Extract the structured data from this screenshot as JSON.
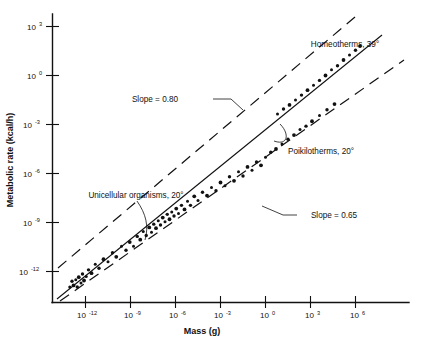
{
  "figure": {
    "title": "",
    "background": "#ffffff",
    "ink_color": "#111111"
  },
  "axes": {
    "x_title": "Mass (g)",
    "y_title": "Metabolic rate (kcal/h)",
    "x_tick_labels": [
      "10-12",
      "10-9",
      "10-6",
      "10-3",
      "100",
      "103",
      "106"
    ],
    "y_tick_labels": [
      "103",
      "100",
      "10-3",
      "10-6",
      "10-9",
      "10-12"
    ],
    "x_mantissa": "10",
    "y_mantissa": "10",
    "x_exponents": [
      "-12",
      "-9",
      "-6",
      "-3",
      "0",
      "3",
      "6"
    ],
    "y_exponents": [
      "3",
      "0",
      "-3",
      "-6",
      "-9",
      "-12"
    ]
  },
  "annotations": {
    "slope_upper": "Slope = 0.80",
    "slope_lower": "Slope = 0.65",
    "homeotherms": "Homeotherms, 39°",
    "poikilotherms": "Poikilotherms, 20°",
    "unicellular": "Unicellular organisms, 20°"
  },
  "chart_data": {
    "type": "scatter",
    "title": "",
    "xlabel": "Mass (g)",
    "ylabel": "Metabolic rate (kcal/h)",
    "xscale": "log10",
    "yscale": "log10",
    "xlim_log": [
      -13.5,
      7.8
    ],
    "ylim_log": [
      -13.5,
      4.2
    ],
    "x_ticks_log": [
      -12,
      -9,
      -6,
      -3,
      0,
      3,
      6
    ],
    "y_ticks_log": [
      3,
      0,
      -3,
      -6,
      -9,
      -12
    ],
    "grid": false,
    "legend": "inline-annotations",
    "regression_lines": [
      {
        "name": "Main regression (overall)",
        "slope": 0.75,
        "label_slope_upper_bound": "Slope = 0.80",
        "label_slope_lower_bound": "Slope = 0.65",
        "x_log_range": [
          -13.2,
          6.6
        ],
        "y_log_range": [
          -12.9,
          2.95
        ]
      }
    ],
    "bounds": [
      {
        "name": "Upper dashed envelope",
        "slope": 0.8,
        "style": "dashed",
        "label": "Slope = 0.80"
      },
      {
        "name": "Lower dashed envelope",
        "slope": 0.65,
        "style": "dashed",
        "label": "Slope = 0.65"
      }
    ],
    "groups": [
      {
        "name": "Unicellular organisms, 20°",
        "temperature_c": 20,
        "x_log_range": [
          -13.0,
          -7.5
        ],
        "note": "lowest mass / lowest metabolic rate cluster"
      },
      {
        "name": "Poikilotherms, 20°",
        "temperature_c": 20,
        "x_log_range": [
          -7.0,
          4.5
        ],
        "note": "middle band of points"
      },
      {
        "name": "Homeotherms, 39°",
        "temperature_c": 39,
        "x_log_range": [
          0.5,
          6.5
        ],
        "note": "upper right band of points, offset above poikilotherms"
      }
    ],
    "points": [
      {
        "x": -13.05,
        "y": -12.95
      },
      {
        "x": -12.9,
        "y": -12.6
      },
      {
        "x": -12.8,
        "y": -12.85
      },
      {
        "x": -12.65,
        "y": -12.5
      },
      {
        "x": -12.55,
        "y": -12.95
      },
      {
        "x": -12.45,
        "y": -12.35
      },
      {
        "x": -12.3,
        "y": -12.7
      },
      {
        "x": -12.2,
        "y": -12.15
      },
      {
        "x": -12.1,
        "y": -12.55
      },
      {
        "x": -11.95,
        "y": -12.3
      },
      {
        "x": -11.8,
        "y": -11.9
      },
      {
        "x": -11.6,
        "y": -12.1
      },
      {
        "x": -11.35,
        "y": -11.55
      },
      {
        "x": -11.1,
        "y": -11.8
      },
      {
        "x": -10.8,
        "y": -11.25
      },
      {
        "x": -10.5,
        "y": -11.4
      },
      {
        "x": -10.2,
        "y": -10.85
      },
      {
        "x": -9.95,
        "y": -11.1
      },
      {
        "x": -9.6,
        "y": -10.45
      },
      {
        "x": -9.3,
        "y": -10.7
      },
      {
        "x": -9.05,
        "y": -10.2
      },
      {
        "x": -8.8,
        "y": -10.45
      },
      {
        "x": -8.55,
        "y": -9.85
      },
      {
        "x": -8.35,
        "y": -10.05
      },
      {
        "x": -8.15,
        "y": -9.55
      },
      {
        "x": -7.95,
        "y": -9.8
      },
      {
        "x": -7.75,
        "y": -9.3
      },
      {
        "x": -7.6,
        "y": -9.6
      },
      {
        "x": -7.45,
        "y": -9.1
      },
      {
        "x": -7.3,
        "y": -9.35
      },
      {
        "x": -7.15,
        "y": -8.9
      },
      {
        "x": -7.0,
        "y": -9.15
      },
      {
        "x": -6.85,
        "y": -8.7
      },
      {
        "x": -6.7,
        "y": -8.95
      },
      {
        "x": -6.55,
        "y": -8.5
      },
      {
        "x": -6.4,
        "y": -8.8
      },
      {
        "x": -6.25,
        "y": -8.35
      },
      {
        "x": -6.1,
        "y": -8.6
      },
      {
        "x": -5.95,
        "y": -8.15
      },
      {
        "x": -5.8,
        "y": -8.45
      },
      {
        "x": -5.6,
        "y": -7.95
      },
      {
        "x": -5.4,
        "y": -8.2
      },
      {
        "x": -5.2,
        "y": -7.7
      },
      {
        "x": -5.0,
        "y": -7.95
      },
      {
        "x": -4.75,
        "y": -7.4
      },
      {
        "x": -4.5,
        "y": -7.65
      },
      {
        "x": -4.2,
        "y": -7.15
      },
      {
        "x": -3.9,
        "y": -7.35
      },
      {
        "x": -3.6,
        "y": -6.85
      },
      {
        "x": -3.3,
        "y": -7.05
      },
      {
        "x": -3.0,
        "y": -6.55
      },
      {
        "x": -2.7,
        "y": -6.75
      },
      {
        "x": -2.4,
        "y": -6.2
      },
      {
        "x": -2.1,
        "y": -6.45
      },
      {
        "x": -1.8,
        "y": -5.9
      },
      {
        "x": -1.5,
        "y": -6.15
      },
      {
        "x": -1.2,
        "y": -5.6
      },
      {
        "x": -0.9,
        "y": -5.8
      },
      {
        "x": -0.6,
        "y": -5.3
      },
      {
        "x": -0.3,
        "y": -5.5
      },
      {
        "x": 0.0,
        "y": -5.0
      },
      {
        "x": 0.35,
        "y": -4.7
      },
      {
        "x": 0.7,
        "y": -4.5
      },
      {
        "x": 1.1,
        "y": -4.2
      },
      {
        "x": 1.5,
        "y": -3.9
      },
      {
        "x": 1.9,
        "y": -3.65
      },
      {
        "x": 2.3,
        "y": -3.3
      },
      {
        "x": 2.7,
        "y": -3.1
      },
      {
        "x": 3.1,
        "y": -2.8
      },
      {
        "x": 3.6,
        "y": -2.45
      },
      {
        "x": 4.1,
        "y": -2.1
      },
      {
        "x": 4.6,
        "y": -1.75
      },
      {
        "x": 0.8,
        "y": -2.35
      },
      {
        "x": 1.2,
        "y": -2.05
      },
      {
        "x": 1.6,
        "y": -1.8
      },
      {
        "x": 2.0,
        "y": -1.5
      },
      {
        "x": 2.4,
        "y": -1.2
      },
      {
        "x": 2.8,
        "y": -0.9
      },
      {
        "x": 3.2,
        "y": -0.6
      },
      {
        "x": 3.6,
        "y": -0.3
      },
      {
        "x": 4.0,
        "y": 0.0
      },
      {
        "x": 4.4,
        "y": 0.35
      },
      {
        "x": 4.8,
        "y": 0.6
      },
      {
        "x": 5.2,
        "y": 0.95
      },
      {
        "x": 5.6,
        "y": 1.25
      },
      {
        "x": 6.0,
        "y": 1.55
      },
      {
        "x": 6.3,
        "y": 1.8
      }
    ]
  }
}
